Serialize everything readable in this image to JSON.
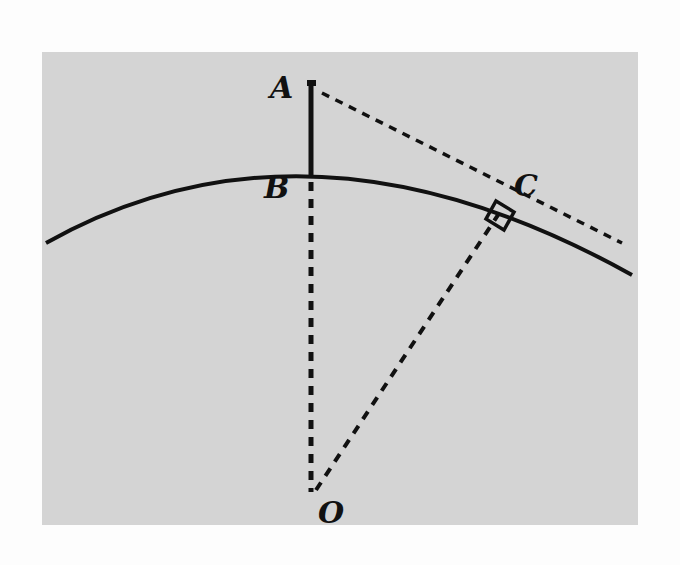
{
  "figure": {
    "type": "geometry-diagram",
    "background_color": "#d4d4d4",
    "stroke_color": "#111111",
    "points": {
      "A": {
        "label": "A",
        "x": 312,
        "y": 83
      },
      "B": {
        "label": "B",
        "x": 310,
        "y": 170
      },
      "C": {
        "label": "C",
        "x": 497,
        "y": 207
      },
      "O": {
        "label": "O",
        "x": 310,
        "y": 490
      }
    },
    "segments": [
      {
        "name": "AB",
        "style": "solid"
      },
      {
        "name": "BO",
        "style": "dashed"
      },
      {
        "name": "OC",
        "style": "dashed"
      },
      {
        "name": "AC",
        "style": "dashed",
        "note": "tangent line extended beyond C"
      }
    ],
    "arc": {
      "name": "circle-arc",
      "style": "solid"
    },
    "right_angle_at": "C"
  }
}
